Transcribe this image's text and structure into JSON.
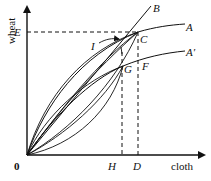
{
  "diagram": {
    "axes": {
      "y_label": "wheat",
      "x_label": "cloth",
      "origin_label": "0"
    },
    "points": {
      "E": "E",
      "C": "C",
      "A": "A",
      "B": "B",
      "I": "I",
      "G": "G",
      "F": "F",
      "A_prime": "A′",
      "H": "H",
      "D": "D"
    },
    "colors": {
      "line": "#111111",
      "background": "#ffffff"
    }
  }
}
